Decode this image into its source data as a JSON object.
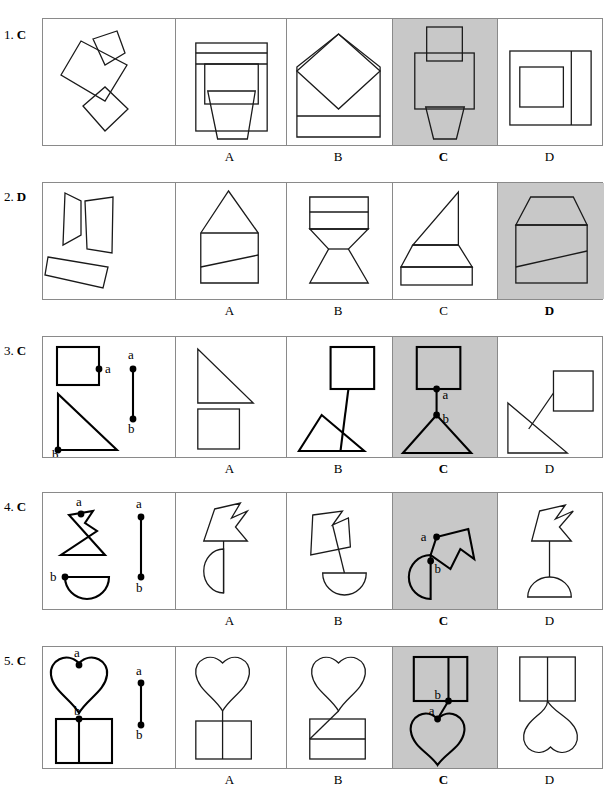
{
  "page": {
    "width": 610,
    "height": 794,
    "background": "#ffffff",
    "shaded_cell_color": "#c8c8c8",
    "stroke_color": "#1a1a1a",
    "frame_border_color": "#8a8a8a"
  },
  "option_labels": [
    "A",
    "B",
    "C",
    "D"
  ],
  "rows": [
    {
      "number": "1.",
      "answer": "C",
      "label": "1. C",
      "correct_option": "C",
      "shaded_option": "C",
      "point_labels": [],
      "cells": [
        {
          "id": "stimulus",
          "shaded": false,
          "description": "three separate tilted quadrilaterals: small trapezoid top right, large tilted square center, small diamond bottom"
        },
        {
          "id": "A",
          "shaded": false,
          "description": "rectangle with two horizontal bands at top, inner rectangle, and a downward trapezoid tab at bottom"
        },
        {
          "id": "B",
          "shaded": false,
          "description": "house-like pentagon with large inscribed diamond and a horizontal band near the bottom"
        },
        {
          "id": "C",
          "shaded": true,
          "description": "vertical rectangle on top of a wider rectangle with a downward trapezoid below"
        },
        {
          "id": "D",
          "shaded": false,
          "description": "large square with vertical divider near right and a smaller square inside on the left"
        }
      ]
    },
    {
      "number": "2.",
      "answer": "D",
      "label": "2. D",
      "correct_option": "D",
      "shaded_option": "D",
      "point_labels": [],
      "cells": [
        {
          "id": "stimulus",
          "shaded": false,
          "description": "three separate quadrilaterals: left trapezoid, right tall quadrilateral, lower tilted rectangle"
        },
        {
          "id": "A",
          "shaded": false,
          "description": "house shape: triangle roof on rectangle with a slanted line across the body"
        },
        {
          "id": "B",
          "shaded": false,
          "description": "hourglass-like figure: banded trapezoid on top of a bowtie/flared base"
        },
        {
          "id": "C",
          "shaded": false,
          "description": "right triangle above a trapezoid and a flat rectangle base"
        },
        {
          "id": "D",
          "shaded": true,
          "description": "pentagon with slanted top corners over a rectangle with a slanted line across"
        }
      ]
    },
    {
      "number": "3.",
      "answer": "C",
      "label": "3. C",
      "correct_option": "C",
      "shaded_option": "C",
      "point_labels": [
        "a",
        "b"
      ],
      "cells": [
        {
          "id": "stimulus",
          "shaded": false,
          "description": "square with point a on right edge, right triangle with point b at bottom-left vertex, and a vertical connector segment a-b"
        },
        {
          "id": "A",
          "shaded": false,
          "description": "right triangle directly above a square, touching"
        },
        {
          "id": "B",
          "shaded": false,
          "description": "square connected by a long slanted line to a triangle below"
        },
        {
          "id": "C",
          "shaded": true,
          "description": "square joined by a short vertical segment (a to b) to the apex of a triangle"
        },
        {
          "id": "D",
          "shaded": false,
          "description": "right triangle with a line from its hypotenuse to a square at upper right"
        }
      ]
    },
    {
      "number": "4.",
      "answer": "C",
      "label": "4. C",
      "correct_option": "C",
      "shaded_option": "C",
      "point_labels": [
        "a",
        "b"
      ],
      "cells": [
        {
          "id": "stimulus",
          "shaded": false,
          "description": "arrow-notched polygon with point a on its top edge, half-disc with point b at its top-left, and a vertical connector segment a-b"
        },
        {
          "id": "A",
          "shaded": false,
          "description": "notched polygon above a left-facing half-disc joined by a vertical line"
        },
        {
          "id": "B",
          "shaded": false,
          "description": "tilted notched polygon above a downward half-disc joined by a slanted line"
        },
        {
          "id": "C",
          "shaded": true,
          "description": "notched polygon rotated right, joined at a to b on a right-facing half-disc"
        },
        {
          "id": "D",
          "shaded": false,
          "description": "notched polygon above a dome/half-disc joined by a vertical line"
        }
      ]
    },
    {
      "number": "5.",
      "answer": "C",
      "label": "5. C",
      "correct_option": "C",
      "shaded_option": "C",
      "point_labels": [
        "a",
        "b"
      ],
      "cells": [
        {
          "id": "stimulus",
          "shaded": false,
          "description": "heart with point a at its top notch, square with point b at top edge and a vertical divider, plus a vertical connector segment a-b"
        },
        {
          "id": "A",
          "shaded": false,
          "description": "heart above a square with a vertical divider, joined at the heart's tip"
        },
        {
          "id": "B",
          "shaded": false,
          "description": "heart with its tip extended diagonally across a divided rectangle"
        },
        {
          "id": "C",
          "shaded": true,
          "description": "divided rectangle above an inverted heart joined by a short segment b to a"
        },
        {
          "id": "D",
          "shaded": false,
          "description": "divided rectangle above an inverted heart joined by a vertical line"
        }
      ]
    }
  ]
}
